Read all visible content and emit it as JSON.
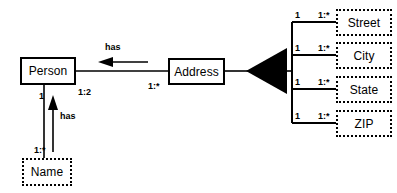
{
  "diagram": {
    "background_color": "#ffffff",
    "line_color": "#000000",
    "entities": [
      {
        "id": "person",
        "label": "Person",
        "style": "solid",
        "x": 20,
        "y": 57,
        "w": 56,
        "h": 28
      },
      {
        "id": "address",
        "label": "Address",
        "style": "solid",
        "x": 168,
        "y": 58,
        "w": 57,
        "h": 27
      },
      {
        "id": "name",
        "label": "Name",
        "style": "dotted",
        "x": 22,
        "y": 158,
        "w": 50,
        "h": 28
      },
      {
        "id": "street",
        "label": "Street",
        "style": "dotted",
        "x": 336,
        "y": 9,
        "w": 56,
        "h": 27
      },
      {
        "id": "city",
        "label": "City",
        "style": "dotted",
        "x": 336,
        "y": 42,
        "w": 56,
        "h": 27
      },
      {
        "id": "state",
        "label": "State",
        "style": "dotted",
        "x": 336,
        "y": 76,
        "w": 56,
        "h": 27
      },
      {
        "id": "zip",
        "label": "ZIP",
        "style": "dotted",
        "x": 336,
        "y": 110,
        "w": 56,
        "h": 27
      }
    ],
    "relationship_labels": [
      {
        "id": "has-address",
        "text": "has",
        "x": 105,
        "y": 43
      },
      {
        "id": "has-name",
        "text": "has",
        "x": 60,
        "y": 112
      }
    ],
    "cardinalities": [
      {
        "id": "person-to-address",
        "text": "1:2",
        "x": 78,
        "y": 88
      },
      {
        "id": "address-to-person",
        "text": "1:*",
        "x": 148,
        "y": 82
      },
      {
        "id": "person-to-name",
        "text": "1",
        "x": 39,
        "y": 92
      },
      {
        "id": "name-to-person",
        "text": "1:*",
        "x": 34,
        "y": 146
      },
      {
        "id": "street-left",
        "text": "1",
        "x": 295,
        "y": 11
      },
      {
        "id": "street-right",
        "text": "1:*",
        "x": 318,
        "y": 11
      },
      {
        "id": "city-left",
        "text": "1",
        "x": 295,
        "y": 42
      },
      {
        "id": "city-right",
        "text": "1:*",
        "x": 318,
        "y": 42
      },
      {
        "id": "state-left",
        "text": "1",
        "x": 295,
        "y": 76
      },
      {
        "id": "state-right",
        "text": "1:*",
        "x": 318,
        "y": 76
      },
      {
        "id": "zip-left",
        "text": "1",
        "x": 295,
        "y": 110
      },
      {
        "id": "zip-right",
        "text": "1:*",
        "x": 318,
        "y": 110
      }
    ]
  }
}
